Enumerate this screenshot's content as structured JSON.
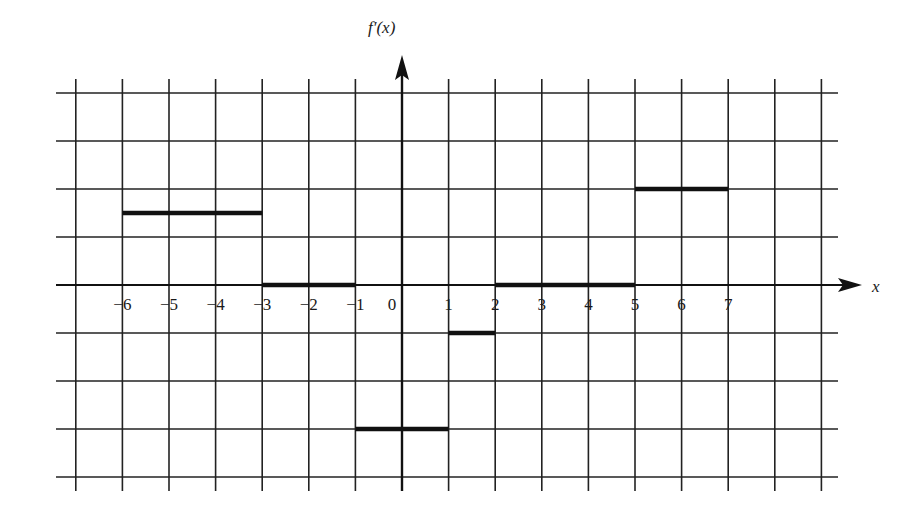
{
  "chart_data": {
    "type": "line",
    "subtype": "step",
    "title": "",
    "xlabel": "x",
    "ylabel": "f′(x)",
    "x_tick_labels": [
      "−6",
      "−5",
      "−4",
      "−3",
      "−2",
      "−1",
      "0",
      "1",
      "2",
      "3",
      "4",
      "5",
      "6",
      "7"
    ],
    "x_ticks": [
      -6,
      -5,
      -4,
      -3,
      -2,
      -1,
      0,
      1,
      2,
      3,
      4,
      5,
      6,
      7
    ],
    "xlim": [
      -7.4,
      9.3
    ],
    "ylim": [
      -4.3,
      4
    ],
    "grid": true,
    "grid_x_range": [
      -7,
      9
    ],
    "grid_y_range": [
      -4,
      4
    ],
    "series": [
      {
        "name": "f'(x)",
        "segments": [
          {
            "x_start": -6,
            "x_end": -3,
            "y": 1.5
          },
          {
            "x_start": -3,
            "x_end": -1,
            "y": 0
          },
          {
            "x_start": -1,
            "x_end": 1,
            "y": -3
          },
          {
            "x_start": 1,
            "x_end": 2,
            "y": -1
          },
          {
            "x_start": 2,
            "x_end": 5,
            "y": 0
          },
          {
            "x_start": 5,
            "x_end": 7,
            "y": 2
          }
        ]
      }
    ],
    "legend": "none"
  },
  "labels": {
    "y_axis": "f′(x)",
    "x_axis": "x"
  }
}
